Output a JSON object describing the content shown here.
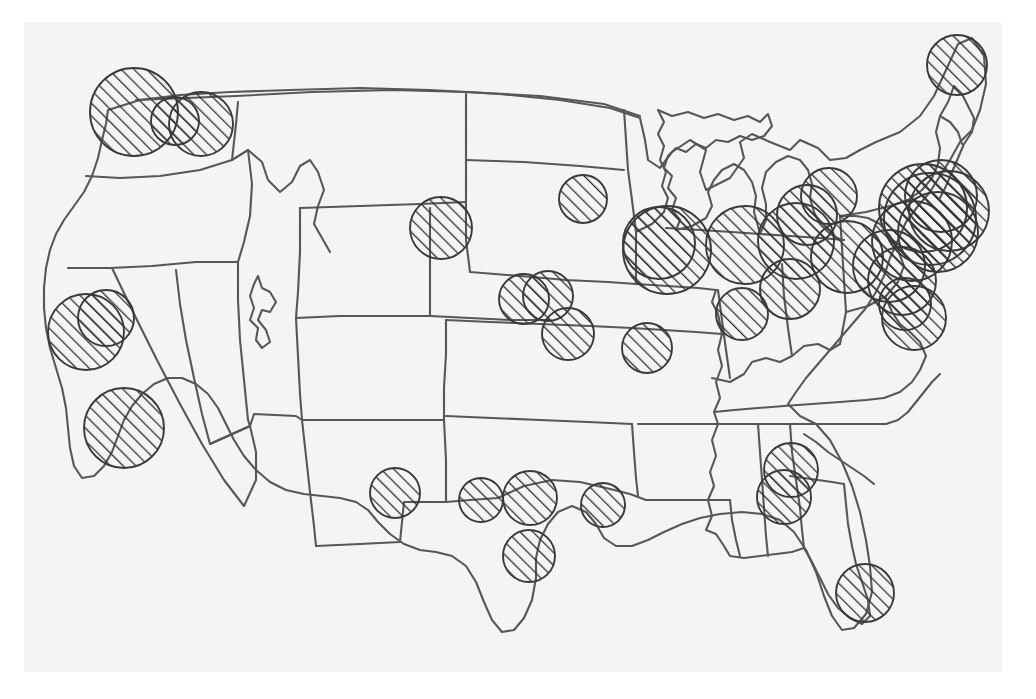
{
  "page": {
    "map_type": "proportional-symbol-map",
    "region": "Contiguous United States",
    "background_color": "#f6f6f6",
    "outline_color": "#575757",
    "symbol_fill": "diagonal-hatch-45",
    "symbol_outline_color": "#3a3a3a",
    "width": 1036,
    "height": 699
  },
  "chart_data": {
    "type": "scatter",
    "xlabel": "",
    "ylabel": "",
    "legend": [],
    "symbol_encoding": "circle-area",
    "points": [
      {
        "label": "Seattle",
        "x": 134,
        "y": 112,
        "r": 44
      },
      {
        "label": "Puget Sound",
        "x": 175,
        "y": 121,
        "r": 24
      },
      {
        "label": "Portland",
        "x": 201,
        "y": 124,
        "r": 32
      },
      {
        "label": "Bismarck",
        "x": 441,
        "y": 228,
        "r": 31
      },
      {
        "label": "Minneapolis",
        "x": 583,
        "y": 199,
        "r": 24
      },
      {
        "label": "San Francisco",
        "x": 86,
        "y": 332,
        "r": 38
      },
      {
        "label": "Sacramento",
        "x": 106,
        "y": 318,
        "r": 28
      },
      {
        "label": "Los Angeles",
        "x": 124,
        "y": 428,
        "r": 40
      },
      {
        "label": "Omaha",
        "x": 524,
        "y": 299,
        "r": 25
      },
      {
        "label": "Lincoln",
        "x": 548,
        "y": 296,
        "r": 25
      },
      {
        "label": "Kansas City",
        "x": 568,
        "y": 334,
        "r": 26
      },
      {
        "label": "St. Louis",
        "x": 647,
        "y": 348,
        "r": 25
      },
      {
        "label": "Chicago",
        "x": 667,
        "y": 250,
        "r": 44
      },
      {
        "label": "Chicago Metro",
        "x": 659,
        "y": 243,
        "r": 36
      },
      {
        "label": "Indianapolis",
        "x": 745,
        "y": 245,
        "r": 39
      },
      {
        "label": "Louisville",
        "x": 742,
        "y": 314,
        "r": 26
      },
      {
        "label": "Detroit",
        "x": 796,
        "y": 241,
        "r": 38
      },
      {
        "label": "Cleveland",
        "x": 807,
        "y": 215,
        "r": 30
      },
      {
        "label": "Columbus",
        "x": 829,
        "y": 196,
        "r": 28
      },
      {
        "label": "Pittsburgh",
        "x": 847,
        "y": 257,
        "r": 36
      },
      {
        "label": "Cincinnati",
        "x": 790,
        "y": 289,
        "r": 30
      },
      {
        "label": "Baltimore",
        "x": 889,
        "y": 266,
        "r": 36
      },
      {
        "label": "Washington DC",
        "x": 902,
        "y": 281,
        "r": 34
      },
      {
        "label": "Philadelphia",
        "x": 912,
        "y": 241,
        "r": 40
      },
      {
        "label": "New York",
        "x": 930,
        "y": 219,
        "r": 46
      },
      {
        "label": "New York Metro",
        "x": 923,
        "y": 208,
        "r": 44
      },
      {
        "label": "Newark",
        "x": 938,
        "y": 232,
        "r": 40
      },
      {
        "label": "Hartford",
        "x": 941,
        "y": 196,
        "r": 36
      },
      {
        "label": "Boston",
        "x": 949,
        "y": 211,
        "r": 40
      },
      {
        "label": "Richmond",
        "x": 914,
        "y": 318,
        "r": 32
      },
      {
        "label": "Norfolk",
        "x": 905,
        "y": 304,
        "r": 26
      },
      {
        "label": "Portland ME",
        "x": 957,
        "y": 65,
        "r": 30
      },
      {
        "label": "El Paso",
        "x": 395,
        "y": 493,
        "r": 25
      },
      {
        "label": "Midland",
        "x": 481,
        "y": 500,
        "r": 22
      },
      {
        "label": "Dallas",
        "x": 530,
        "y": 498,
        "r": 27
      },
      {
        "label": "Houston",
        "x": 529,
        "y": 556,
        "r": 26
      },
      {
        "label": "Shreveport",
        "x": 603,
        "y": 505,
        "r": 22
      },
      {
        "label": "Atlanta",
        "x": 791,
        "y": 470,
        "r": 27
      },
      {
        "label": "Macon",
        "x": 784,
        "y": 497,
        "r": 27
      },
      {
        "label": "Miami",
        "x": 865,
        "y": 593,
        "r": 29
      }
    ]
  }
}
